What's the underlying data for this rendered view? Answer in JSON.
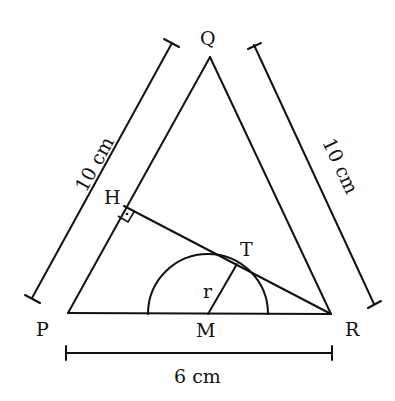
{
  "figure": {
    "type": "geometry-diagram",
    "stroke_color": "#111111",
    "background": "#ffffff"
  },
  "points": {
    "P": {
      "label": "P",
      "x": 68,
      "y": 313
    },
    "Q": {
      "label": "Q",
      "x": 210,
      "y": 57
    },
    "R": {
      "label": "R",
      "x": 331,
      "y": 314
    },
    "H": {
      "label": "H",
      "x": 124,
      "y": 206
    },
    "T": {
      "label": "T",
      "x": 237,
      "y": 264
    },
    "M": {
      "label": "M",
      "x": 208,
      "y": 314
    }
  },
  "labels": {
    "P": "P",
    "Q": "Q",
    "R": "R",
    "H": "H",
    "T": "T",
    "M": "M",
    "radius": "r"
  },
  "dimensions": {
    "PQ": {
      "text": "10 cm",
      "side": "left"
    },
    "QR": {
      "text": "10 cm",
      "side": "right"
    },
    "PR": {
      "text": "6 cm",
      "side": "bottom"
    }
  },
  "semicircle": {
    "center": "M",
    "radius_px": 60,
    "radius_label": "r"
  },
  "right_angle_marker": {
    "at": "H",
    "between": [
      "HP",
      "HR"
    ]
  }
}
